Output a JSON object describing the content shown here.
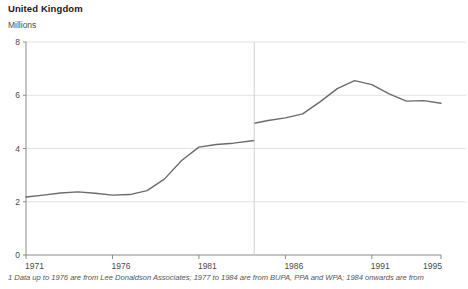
{
  "chart": {
    "title": "United Kingdom",
    "subtitle": "Millions",
    "footnote": "1 Data up to 1976 are from Lee Donaldson Associates; 1977 to 1984 are from BUPA, PPA and WPA; 1984 onwards are from"
  },
  "chart_data": {
    "type": "line",
    "title": "United Kingdom",
    "subtitle": "Millions",
    "xlabel": "",
    "ylabel": "Millions",
    "xlim": [
      1971,
      1995
    ],
    "ylim": [
      0,
      8
    ],
    "yticks": [
      0,
      2,
      4,
      6,
      8
    ],
    "ytick_labels": [
      "0",
      "2",
      "4",
      "6",
      "8"
    ],
    "xticks": [
      1971,
      1976,
      1981,
      1986,
      1991,
      1995
    ],
    "xtick_labels": [
      "1971",
      "1976",
      "1981",
      "1986",
      "1991",
      "1995"
    ],
    "grid": "horizontal",
    "legend": "none",
    "line_color": "#6b6b6b",
    "break_year": 1984.2,
    "break_marker": "vertical-divider",
    "series": [
      {
        "name": "Persons covered by private medical insurance (1971-1984)",
        "x": [
          1971,
          1972,
          1973,
          1974,
          1975,
          1976,
          1977,
          1978,
          1979,
          1980,
          1981,
          1982,
          1983,
          1984.2
        ],
        "values": [
          2.18,
          2.25,
          2.33,
          2.37,
          2.32,
          2.25,
          2.27,
          2.42,
          2.85,
          3.55,
          4.05,
          4.15,
          4.2,
          4.3
        ]
      },
      {
        "name": "Persons covered by private medical insurance (1984-1995)",
        "x": [
          1984.2,
          1985,
          1986,
          1987,
          1988,
          1989,
          1990,
          1991,
          1992,
          1993,
          1994,
          1995
        ],
        "values": [
          4.95,
          5.05,
          5.15,
          5.3,
          5.75,
          6.25,
          6.55,
          6.4,
          6.05,
          5.78,
          5.8,
          5.7
        ]
      }
    ],
    "footnote": "1 Data up to 1976 are from Lee Donaldson Associates; 1977 to 1984 are from BUPA, PPA and WPA; 1984 onwards are from"
  }
}
